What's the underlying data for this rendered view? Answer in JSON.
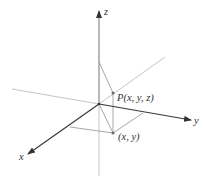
{
  "diagram": {
    "type": "3d-coordinate-system",
    "axes": {
      "x": {
        "label": "x"
      },
      "y": {
        "label": "y"
      },
      "z": {
        "label": "z"
      }
    },
    "points": {
      "P": {
        "label": "P(x, y, z)"
      },
      "projection": {
        "label": "(x, y)"
      }
    },
    "colors": {
      "axis_dark": "#3a3a3a",
      "axis_light": "#bdbdbd",
      "construction": "#a8a8a8",
      "point": "#6a6a6a"
    }
  }
}
